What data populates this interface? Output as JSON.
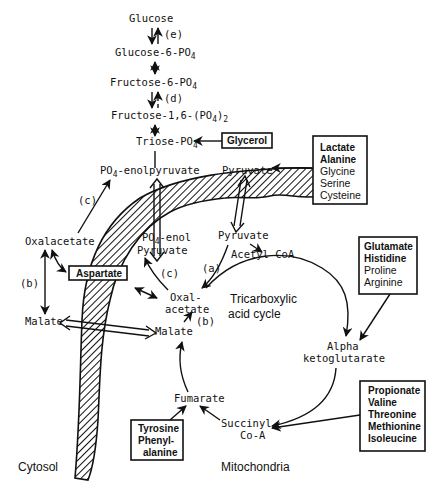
{
  "diagram": {
    "compartments": {
      "cytosol": "Cytosol",
      "mitochondria": "Mitochondria"
    },
    "cycle_label": [
      "Tricarboxylic",
      "acid cycle"
    ],
    "glycolysis": {
      "glucose": "Glucose",
      "g6p": "Glucose-6-PO",
      "f6p": "Fructose-6-PO",
      "f16bp_a": "Fructose-1,6-(PO",
      "f16bp_b": ")",
      "triose": "Triose-PO",
      "sub4": "4",
      "sub2": "2"
    },
    "cytosol_metabolites": {
      "pep": "-enolpyruvate",
      "pep_prefix": "PO",
      "pyruvate": "Pyruvate",
      "oxalacetate": "Oxalacetate",
      "malate": "Malate",
      "aspartate": "Aspartate"
    },
    "mito_metabolites": {
      "pep_a": "-enol",
      "pep_prefix": "PO",
      "pep_b": "Pyruvate",
      "pyruvate": "Pyruvate",
      "acetyl_coa": "Acetyl-CoA",
      "oxal_a": "Oxal-",
      "oxal_b": "acetate",
      "malate": "Malate",
      "alpha_a": "Alpha",
      "alpha_b": "ketoglutarate",
      "fumarate": "Fumarate",
      "succ_a": "Succinyl",
      "succ_b": "Co-A"
    },
    "enzyme_labels": {
      "a": "(a)",
      "b": "(b)",
      "c": "(c)",
      "d": "(d)",
      "e": "(e)"
    },
    "source_boxes": {
      "glycerol": [
        "Glycerol"
      ],
      "pyruvate_sources": [
        "Lactate",
        "Alanine",
        "Glycine",
        "Serine",
        "Cysteine"
      ],
      "akg_sources": [
        "Glutamate",
        "Histidine",
        "Proline",
        "Arginine"
      ],
      "succ_sources": [
        "Propionate",
        "Valine",
        "Threonine",
        "Methionine",
        "Isoleucine"
      ],
      "fumarate_sources": [
        "Tyrosine",
        "Phenyl-",
        "alanine"
      ]
    }
  }
}
